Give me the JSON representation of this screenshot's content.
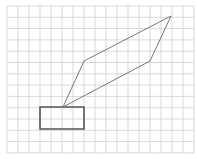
{
  "diagram": {
    "type": "grid-geometry",
    "canvas": {
      "width": 197,
      "height": 159,
      "background": "#ffffff"
    },
    "grid": {
      "x0": 7,
      "y0": 6,
      "step_x": 11,
      "step_y": 11.3,
      "columns": 17,
      "rows": 13,
      "line_color": "#cfcfcf",
      "line_width": 0.8
    },
    "shapes": [
      {
        "name": "rectangle",
        "kind": "polygon",
        "points": [
          [
            40,
            107
          ],
          [
            84,
            107
          ],
          [
            84,
            129
          ],
          [
            40,
            129
          ]
        ],
        "stroke": "#555555",
        "stroke_width": 1.6
      },
      {
        "name": "parallelogram",
        "kind": "polygon",
        "points": [
          [
            63,
            107
          ],
          [
            84,
            61
          ],
          [
            171,
            16
          ],
          [
            150,
            61
          ]
        ],
        "stroke": "#777777",
        "stroke_width": 1
      }
    ]
  }
}
